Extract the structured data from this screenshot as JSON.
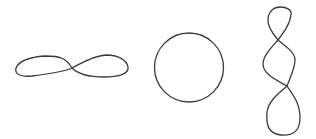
{
  "figure": {
    "background": "#ffffff",
    "stroke_color": "#3a3a3a",
    "stroke_width": 1.3,
    "shapes": [
      {
        "id": "horizontal-figure-eight",
        "type": "figure-eight",
        "crossings": 1,
        "orientation": "horizontal",
        "path": "M72,68 C66,58 60,56 45,56 C30,57 19,61 16,68 C14,75 22,77 32,76 C48,74 64,72 72,68 C80,64 92,56 106,55 C118,55 127,60 128,67 C129,74 119,77 104,77 C90,77 78,74 72,68 Z"
      },
      {
        "id": "circle",
        "type": "circle",
        "crossings": 0,
        "cx": 189,
        "cy": 67.5,
        "r": 34.5
      },
      {
        "id": "vertical-double-twist",
        "type": "twisted-loop",
        "crossings": 2,
        "orientation": "vertical",
        "path": "M278,40 C272,33 267,26 268,18 C269,11 274,7 280,7 C287,7 292,10 291,15 C290,24 284,32 278,40 C271,48 263,56 263,64 C263,74 276,80 287,86 C282,91 269,99 267,112 C266,124 268,134 281,135 C294,136 300,130 300,118 C300,102 292,94 287,86 C290,78 295,68 295,60 C295,52 285,46 278,40 Z"
      }
    ]
  }
}
